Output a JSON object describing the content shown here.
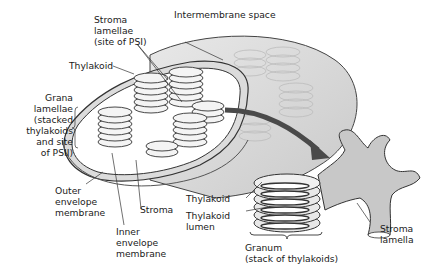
{
  "diagram": {
    "colors": {
      "membrane_fill": "#d9d9d9",
      "stroma_lamella_fill": "#c8c8c8",
      "outline": "#333333",
      "arrow": "#4a4a4a",
      "background": "#ffffff"
    },
    "labels": {
      "stroma_lamellae": "Stroma\nlamellae\n(site of PSI)",
      "intermembrane_space": "Intermembrane space",
      "thylakoid_top": "Thylakoid",
      "grana_lamellae": "Grana\nlamellae\n(stacked\nthylakoids\nand site\nof PSII)",
      "outer_envelope": "Outer\nenvelope\nmembrane",
      "stroma": "Stroma",
      "inner_envelope": "Inner\nenvelope\nmembrane",
      "thylakoid_detail": "Thylakoid",
      "thylakoid_lumen": "Thylakoid\nlumen",
      "granum": "Granum\n(stack of thylakoids)",
      "stroma_lamella": "Stroma\nlamella"
    }
  }
}
